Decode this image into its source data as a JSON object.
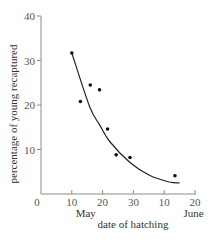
{
  "chart_data": {
    "type": "scatter",
    "title": "",
    "xlabel": "date of hatching",
    "ylabel": "percentage of young recaptured",
    "xlim": [
      0,
      50
    ],
    "ylim": [
      0,
      40
    ],
    "x_ticks": [
      0,
      10,
      20,
      30,
      40,
      50
    ],
    "x_tick_labels": [
      "0",
      "10",
      "20",
      "30",
      "10",
      "20"
    ],
    "y_ticks": [
      10,
      20,
      30,
      40
    ],
    "y_tick_labels": [
      "10",
      "20",
      "30",
      "40"
    ],
    "month_labels": [
      {
        "text": "May",
        "under_tick": 10
      },
      {
        "text": "June",
        "under_tick": 45
      }
    ],
    "grid": false,
    "legend": null,
    "series": [
      {
        "name": "observed",
        "kind": "points",
        "points": [
          {
            "x": 10,
            "y": 31.7
          },
          {
            "x": 12.8,
            "y": 20.8
          },
          {
            "x": 16,
            "y": 24.5
          },
          {
            "x": 19,
            "y": 23.4
          },
          {
            "x": 21.6,
            "y": 14.6
          },
          {
            "x": 24.4,
            "y": 8.8
          },
          {
            "x": 28.9,
            "y": 8.2
          },
          {
            "x": 43.5,
            "y": 4.1
          }
        ]
      },
      {
        "name": "fitted curve",
        "kind": "line",
        "points": [
          {
            "x": 10,
            "y": 31.7
          },
          {
            "x": 15.8,
            "y": 19.6
          },
          {
            "x": 19,
            "y": 15.6
          },
          {
            "x": 22.3,
            "y": 11.8
          },
          {
            "x": 28.7,
            "y": 7.2
          },
          {
            "x": 35.2,
            "y": 4.2
          },
          {
            "x": 41.6,
            "y": 2.7
          },
          {
            "x": 45,
            "y": 2.5
          }
        ]
      }
    ]
  }
}
